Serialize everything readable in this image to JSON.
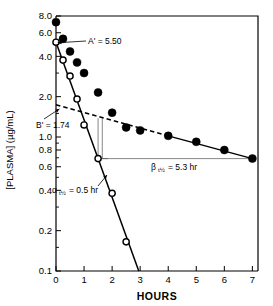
{
  "chart_data": {
    "type": "scatter",
    "title": "",
    "xlabel": "HOURS",
    "ylabel": "[PLASMA] (µg/mL)",
    "yscale": "log",
    "xlim": [
      0,
      7.2
    ],
    "ylim": [
      0.1,
      8.0
    ],
    "grid": false,
    "legend": "none",
    "x_ticks": [
      0,
      1,
      2,
      3,
      4,
      5,
      6,
      7
    ],
    "x_tick_labels": [
      "0",
      "1",
      "2",
      "3",
      "4",
      "5",
      "6",
      "7"
    ],
    "y_ticks": [
      8.0,
      6.0,
      4.0,
      2.0,
      1.0,
      0.8,
      0.6,
      0.4,
      0.2,
      0.1
    ],
    "y_tick_labels": [
      "8.0",
      "6.0",
      "4.0",
      "2.0",
      "1.0",
      "0.8",
      "0.6",
      "0.4",
      "0.2",
      "0.1"
    ],
    "y_minor_ticks": [
      7.0,
      5.0,
      3.0,
      1.5,
      0.9,
      0.7,
      0.5,
      0.3,
      0.15
    ],
    "series": [
      {
        "name": "observed plasma concentration",
        "marker": "filled-circle",
        "x": [
          0.0,
          0.25,
          0.5,
          0.75,
          1.0,
          1.5,
          2.0,
          2.5,
          3.0,
          4.0,
          5.0,
          6.0,
          7.0
        ],
        "y": [
          7.2,
          5.4,
          4.35,
          3.6,
          3.0,
          2.15,
          1.52,
          1.18,
          1.12,
          1.02,
          0.92,
          0.8,
          0.69
        ]
      },
      {
        "name": "residual (alpha phase)",
        "marker": "open-circle",
        "x": [
          0.0,
          0.25,
          0.5,
          0.75,
          1.0,
          1.5,
          2.0,
          2.5
        ],
        "y": [
          5.1,
          3.75,
          2.85,
          1.92,
          1.23,
          0.69,
          0.38,
          0.165
        ]
      }
    ],
    "lines": [
      {
        "name": "residual-regression-line",
        "style": "solid",
        "x": [
          0.0,
          2.95
        ],
        "y": [
          5.1,
          0.1
        ]
      },
      {
        "name": "terminal-beta-line",
        "style": "solid",
        "x": [
          4.0,
          7.0
        ],
        "y": [
          1.02,
          0.69
        ]
      },
      {
        "name": "beta-extrapolation-line",
        "style": "dashed",
        "x": [
          0.0,
          4.0
        ],
        "y": [
          1.74,
          1.02
        ]
      }
    ],
    "annotations": [
      {
        "id": "A-prime",
        "text": "A' = 5.50",
        "value": 5.5,
        "unit": "µg/mL",
        "points_to": {
          "x": 0.0,
          "y": 5.1
        }
      },
      {
        "id": "B-prime",
        "text": "B' = 1.74",
        "value": 1.74,
        "unit": "µg/mL",
        "points_to": {
          "x": 0.0,
          "y": 1.74
        }
      },
      {
        "id": "alpha-half",
        "text": "= 0.5 hr",
        "symbol": "α",
        "subscript": "t½",
        "value": 0.5,
        "unit": "hr"
      },
      {
        "id": "beta-half",
        "text": "= 5.3 hr",
        "symbol": "β",
        "subscript": "t½",
        "value": 5.3,
        "unit": "hr"
      }
    ],
    "construction_guides": [
      {
        "name": "alpha-half-life-step",
        "from": {
          "x": 1.5,
          "y": 1.38
        },
        "corner": {
          "x": 1.5,
          "y": 0.69
        },
        "to": {
          "x": 1.85,
          "y": 0.69
        }
      },
      {
        "name": "beta-half-life-step",
        "from": {
          "x": 1.65,
          "y": 1.38
        },
        "corner": {
          "x": 1.65,
          "y": 0.69
        },
        "to": {
          "x": 6.95,
          "y": 0.69
        }
      }
    ]
  },
  "axes": {
    "x_title": "HOURS",
    "y_title": "[PLASMA] (µg/mL)"
  },
  "labels": {
    "a_prime": "A' = 5.50",
    "b_prime": "B' = 1.74",
    "alpha_symbol": "α",
    "alpha_subscript": "t½",
    "alpha_value": "= 0.5 hr",
    "beta_symbol": "β",
    "beta_subscript": "t½",
    "beta_value": "= 5.3 hr"
  }
}
